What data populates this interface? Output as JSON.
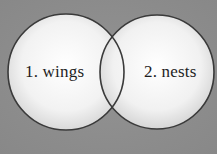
{
  "diagram": {
    "type": "venn",
    "background_color": "#8c8c8c",
    "circle_fill": "#f4f4f4",
    "circle_stroke": "#3a3a3a",
    "circles": [
      {
        "label": "1. wings",
        "cx": 66,
        "cy": 72,
        "r": 58
      },
      {
        "label": "2. nests",
        "cx": 157,
        "cy": 72,
        "r": 57
      }
    ],
    "overlap_label": ""
  }
}
